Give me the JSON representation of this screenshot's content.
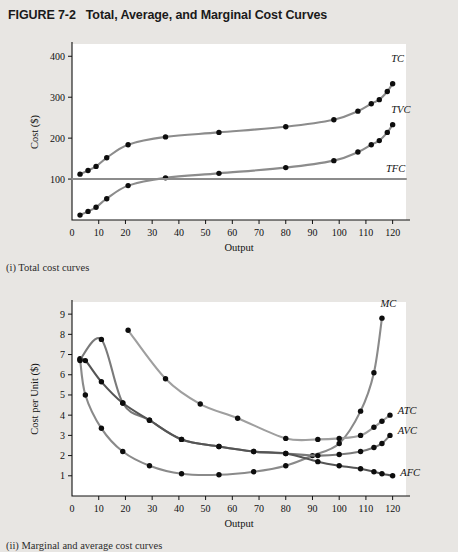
{
  "figure": {
    "number": "FIGURE 7-2",
    "title": "Total, Average, and Marginal Cost Curves"
  },
  "captions": {
    "top": "(i) Total cost curves",
    "bottom": "(ii) Marginal and average cost curves"
  },
  "colors": {
    "page_background": "#e8e6e3",
    "plot_background": "#ffffff",
    "axis": "#111111",
    "marker": "#0d0d0d",
    "tc": "#8c8c8c",
    "tvc": "#8c8c8c",
    "tfc": "#8c8c8c",
    "mc": "#8a8a8a",
    "atc": "#9f9f9f",
    "avc": "#7a7a7a",
    "afc": "#555555"
  },
  "chart_data": [
    {
      "type": "line",
      "id": "total-cost-curves",
      "title": "(i) Total cost curves",
      "xlabel": "Output",
      "ylabel": "Cost ($)",
      "xlim": [
        0,
        125
      ],
      "ylim": [
        0,
        430
      ],
      "xticks": [
        0,
        10,
        20,
        30,
        40,
        50,
        60,
        70,
        80,
        90,
        100,
        110,
        120
      ],
      "yticks": [
        100,
        200,
        300,
        400
      ],
      "grid": false,
      "legend_position": "right-inline",
      "series": [
        {
          "name": "TC",
          "label": "TC",
          "color": "#8c8c8c",
          "x": [
            3,
            6,
            9,
            13,
            21,
            35,
            55,
            80,
            98,
            107,
            112,
            115,
            118,
            120
          ],
          "y": [
            112,
            121,
            131,
            152,
            184,
            203,
            214,
            228,
            245,
            266,
            284,
            294,
            314,
            333
          ]
        },
        {
          "name": "TVC",
          "label": "TVC",
          "color": "#8c8c8c",
          "x": [
            3,
            6,
            9,
            13,
            21,
            35,
            55,
            80,
            98,
            107,
            112,
            115,
            118,
            120
          ],
          "y": [
            12,
            21,
            31,
            52,
            84,
            103,
            114,
            128,
            145,
            166,
            184,
            194,
            214,
            233
          ]
        },
        {
          "name": "TFC",
          "label": "TFC",
          "color": "#8c8c8c",
          "x": [
            0,
            125
          ],
          "y": [
            100,
            100
          ],
          "markers": false
        }
      ]
    },
    {
      "type": "line",
      "id": "average-marginal-cost-curves",
      "title": "(ii) Marginal and average cost curves",
      "xlabel": "Output",
      "ylabel": "Cost per Unit ($)",
      "xlim": [
        0,
        125
      ],
      "ylim": [
        0,
        9.6
      ],
      "xticks": [
        0,
        10,
        20,
        30,
        40,
        50,
        60,
        70,
        80,
        90,
        100,
        110,
        120
      ],
      "yticks": [
        1,
        2,
        3,
        4,
        5,
        6,
        7,
        8,
        9
      ],
      "grid": false,
      "legend_position": "right-inline",
      "series": [
        {
          "name": "MC",
          "label": "MC",
          "color": "#8a8a8a",
          "x": [
            3,
            5,
            11,
            19,
            29,
            41,
            55,
            68,
            80,
            90,
            100,
            108,
            113,
            116
          ],
          "y": [
            6.8,
            5.0,
            3.35,
            2.2,
            1.5,
            1.1,
            1.05,
            1.2,
            1.5,
            2.0,
            2.6,
            4.2,
            6.1,
            8.8
          ]
        },
        {
          "name": "ATC",
          "label": "ATC",
          "color": "#9f9f9f",
          "x": [
            21,
            35,
            48,
            62,
            80,
            92,
            100,
            108,
            113,
            116,
            119
          ],
          "y": [
            8.2,
            5.8,
            4.55,
            3.85,
            2.85,
            2.8,
            2.85,
            3.0,
            3.4,
            3.7,
            4.0
          ]
        },
        {
          "name": "AVC",
          "label": "AVC",
          "color": "#7a7a7a",
          "x": [
            3,
            11,
            19,
            29,
            41,
            55,
            68,
            80,
            92,
            100,
            108,
            113,
            116,
            119
          ],
          "y": [
            6.75,
            7.75,
            4.6,
            3.75,
            2.8,
            2.45,
            2.2,
            2.1,
            2.0,
            2.05,
            2.2,
            2.4,
            2.6,
            3.0
          ]
        },
        {
          "name": "AFC",
          "label": "AFC",
          "color": "#555555",
          "x": [
            3,
            5,
            11,
            19,
            29,
            41,
            55,
            68,
            80,
            92,
            100,
            108,
            113,
            116,
            120
          ],
          "y": [
            6.7,
            6.7,
            5.65,
            4.6,
            3.75,
            2.8,
            2.45,
            2.2,
            2.1,
            1.7,
            1.5,
            1.35,
            1.2,
            1.1,
            1.0
          ]
        }
      ]
    }
  ]
}
